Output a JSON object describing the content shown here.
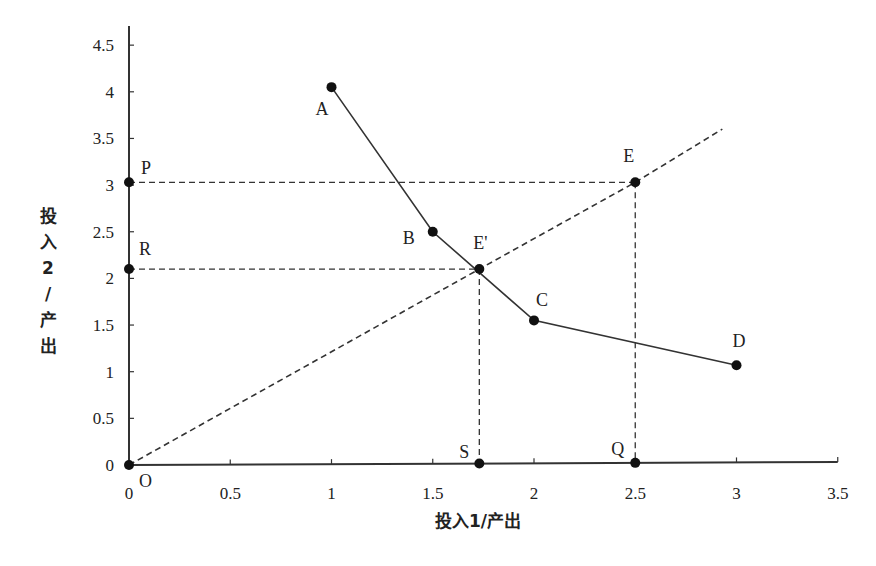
{
  "chart_data": {
    "type": "line",
    "title": "",
    "xlabel": "投入1/产出",
    "ylabel": "投入2/产出",
    "ylabel_vertical": [
      "投",
      "入",
      "2",
      "/",
      "产",
      "出"
    ],
    "xlim": [
      0,
      3.5
    ],
    "ylim": [
      0,
      4.5
    ],
    "x_ticks": [
      "0",
      "0.5",
      "1",
      "1.5",
      "2",
      "2.5",
      "3",
      "3.5"
    ],
    "y_ticks": [
      "0",
      "0.5",
      "1",
      "1.5",
      "2",
      "2.5",
      "3",
      "3.5",
      "4",
      "4.5"
    ],
    "grid": false,
    "series": [
      {
        "name": "frontier",
        "style": "solid",
        "points": [
          {
            "label": "A",
            "x": 1.0,
            "y": 4.05
          },
          {
            "label": "B",
            "x": 1.5,
            "y": 2.5
          },
          {
            "label": "C",
            "x": 2.0,
            "y": 1.55
          },
          {
            "label": "D",
            "x": 3.0,
            "y": 1.07
          }
        ]
      },
      {
        "name": "ray-from-origin",
        "style": "dashed",
        "points": [
          {
            "label": "O",
            "x": 0,
            "y": 0
          },
          {
            "label": "E'",
            "x": 1.73,
            "y": 2.1
          },
          {
            "label": "E",
            "x": 2.5,
            "y": 3.03
          },
          {
            "label": "",
            "x": 2.93,
            "y": 3.6
          }
        ]
      }
    ],
    "extra_points": [
      {
        "label": "P",
        "x": 0,
        "y": 3.03
      },
      {
        "label": "R",
        "x": 0,
        "y": 2.1
      },
      {
        "label": "S",
        "x": 1.73,
        "y": 0
      },
      {
        "label": "Q",
        "x": 2.5,
        "y": 0
      }
    ],
    "dashed_guides": [
      {
        "from": "P",
        "to": "E"
      },
      {
        "from": "R",
        "to": "E'"
      },
      {
        "from": "E'",
        "to": "S"
      },
      {
        "from": "E",
        "to": "Q"
      }
    ]
  }
}
